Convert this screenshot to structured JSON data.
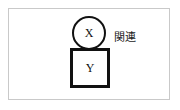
{
  "figure": {
    "nodes": [
      {
        "id": "x-node",
        "shape": "circle",
        "label": "X"
      },
      {
        "id": "y-node",
        "shape": "square",
        "label": "Y"
      }
    ],
    "annotation": "関連",
    "colors": {
      "stroke": "#111111",
      "frame": "#c9c9c9",
      "background": "#ffffff",
      "text": "#1a1a1a"
    }
  }
}
